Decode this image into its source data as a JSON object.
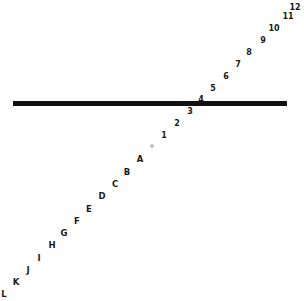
{
  "figure": {
    "background_color": "#ffffff",
    "width": 304,
    "height": 301
  },
  "bar": {
    "name": "horizontal-black-bar",
    "color": "#111111",
    "x": 13,
    "y": 101,
    "width": 274,
    "height": 5
  },
  "marker_dot": {
    "name": "gray-dot-marker",
    "color": "#b9b9bd",
    "x": 152,
    "y": 146
  },
  "labels": [
    {
      "text": "12",
      "x": 295,
      "y": 8,
      "kind": "number"
    },
    {
      "text": "11",
      "x": 288,
      "y": 17,
      "kind": "number"
    },
    {
      "text": "10",
      "x": 274,
      "y": 29,
      "kind": "number"
    },
    {
      "text": "9",
      "x": 263,
      "y": 41,
      "kind": "number"
    },
    {
      "text": "8",
      "x": 249,
      "y": 53,
      "kind": "number"
    },
    {
      "text": "7",
      "x": 238,
      "y": 65,
      "kind": "number"
    },
    {
      "text": "6",
      "x": 226,
      "y": 77,
      "kind": "number"
    },
    {
      "text": "5",
      "x": 213,
      "y": 89,
      "kind": "number"
    },
    {
      "text": "4",
      "x": 201,
      "y": 100,
      "kind": "number"
    },
    {
      "text": "3",
      "x": 190,
      "y": 112,
      "kind": "number"
    },
    {
      "text": "2",
      "x": 177,
      "y": 124,
      "kind": "number"
    },
    {
      "text": "1",
      "x": 164,
      "y": 136,
      "kind": "number"
    },
    {
      "text": "A",
      "x": 140,
      "y": 159,
      "kind": "letter"
    },
    {
      "text": "B",
      "x": 127,
      "y": 172,
      "kind": "letter"
    },
    {
      "text": "C",
      "x": 115,
      "y": 184,
      "kind": "letter"
    },
    {
      "text": "D",
      "x": 102,
      "y": 196,
      "kind": "letter"
    },
    {
      "text": "E",
      "x": 89,
      "y": 209,
      "kind": "letter"
    },
    {
      "text": "F",
      "x": 77,
      "y": 221,
      "kind": "letter"
    },
    {
      "text": "G",
      "x": 64,
      "y": 233,
      "kind": "letter"
    },
    {
      "text": "H",
      "x": 52,
      "y": 245,
      "kind": "letter"
    },
    {
      "text": "I",
      "x": 39,
      "y": 258,
      "kind": "letter"
    },
    {
      "text": "J",
      "x": 28,
      "y": 270,
      "kind": "letter"
    },
    {
      "text": "K",
      "x": 16,
      "y": 282,
      "kind": "letter"
    },
    {
      "text": "L",
      "x": 4,
      "y": 294,
      "kind": "letter"
    }
  ]
}
